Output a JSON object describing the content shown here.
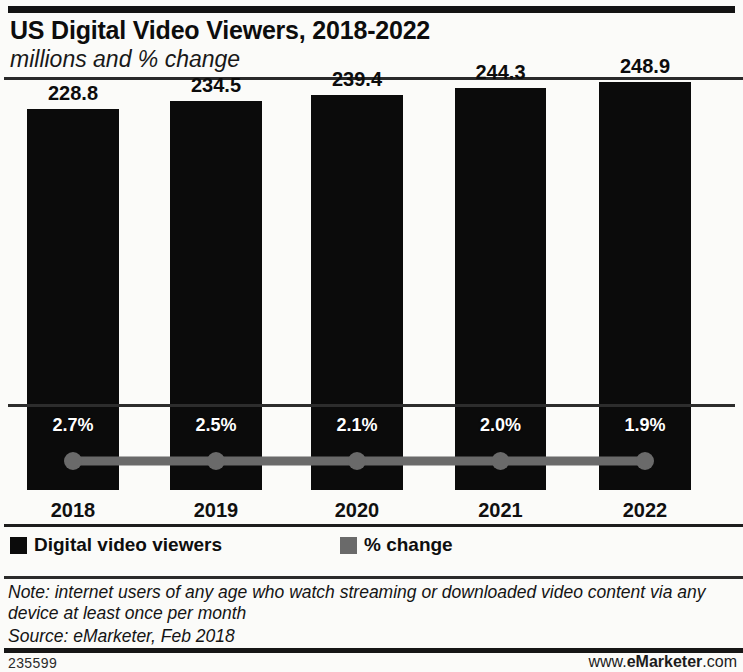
{
  "header": {
    "title": "US Digital Video Viewers, 2018-2022",
    "subtitle": "millions and % change"
  },
  "footer": {
    "note": "Note: internet users of any age who watch streaming or downloaded video content via any device at least once per month",
    "source": "Source: eMarketer, Feb 2018",
    "chart_id": "235599",
    "watermark_prefix": "www.",
    "watermark_brand": "eMarketer",
    "watermark_suffix": ".com"
  },
  "colors": {
    "bar": "#0b0b0b",
    "line": "#5f5f5f",
    "marker": "#6a6a6a",
    "background": "#fbfbf9",
    "text": "#111111"
  },
  "chart_data": {
    "type": "bar",
    "title": "US Digital Video Viewers, 2018-2022",
    "subtitle": "millions and % change",
    "xlabel": "",
    "ylabel": "",
    "grid": false,
    "legend_position": "bottom-left",
    "categories": [
      "2018",
      "2019",
      "2020",
      "2021",
      "2022"
    ],
    "ylim": [
      0,
      260
    ],
    "series": [
      {
        "name": "Digital video viewers",
        "type": "bar",
        "unit": "millions",
        "color": "#0b0b0b",
        "values": [
          228.8,
          234.5,
          239.4,
          244.3,
          248.9
        ],
        "labels": [
          "228.8",
          "234.5",
          "239.4",
          "244.3",
          "248.9"
        ]
      },
      {
        "name": "% change",
        "type": "line",
        "unit": "percent",
        "color": "#6a6a6a",
        "values": [
          2.7,
          2.5,
          2.1,
          2.0,
          1.9
        ],
        "labels": [
          "2.7%",
          "2.5%",
          "2.1%",
          "2.0%",
          "1.9%"
        ]
      }
    ]
  },
  "legend": {
    "items": [
      {
        "label": "Digital video viewers",
        "color": "#0b0b0b"
      },
      {
        "label": "% change",
        "color": "#6a6a6a"
      }
    ]
  }
}
